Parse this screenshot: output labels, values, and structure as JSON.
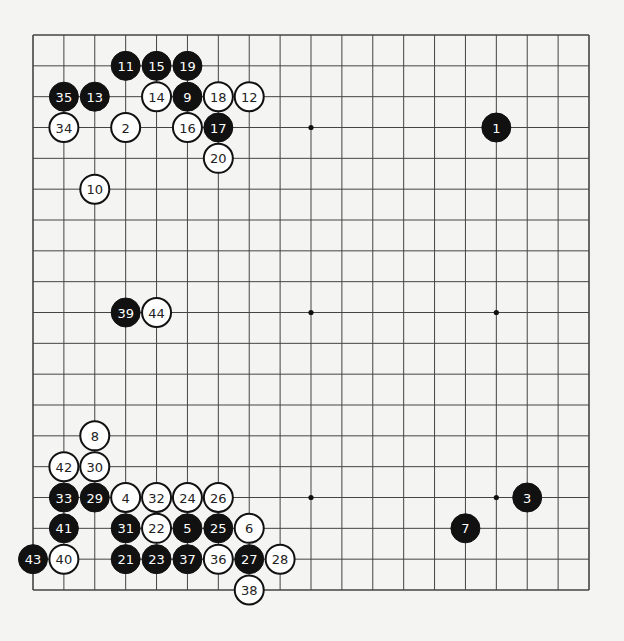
{
  "game": {
    "board_size": 19,
    "star_points": [
      [
        3,
        3
      ],
      [
        3,
        9
      ],
      [
        3,
        15
      ],
      [
        9,
        3
      ],
      [
        9,
        9
      ],
      [
        9,
        15
      ],
      [
        15,
        3
      ],
      [
        15,
        9
      ],
      [
        15,
        15
      ]
    ],
    "colors": {
      "black": "#111111",
      "white": "#ffffff",
      "line": "#444444",
      "board": "#f4f4f2"
    },
    "stones": [
      {
        "n": 1,
        "color": "black",
        "col": 15,
        "row": 3
      },
      {
        "n": 2,
        "color": "white",
        "col": 3,
        "row": 3
      },
      {
        "n": 3,
        "color": "black",
        "col": 16,
        "row": 15
      },
      {
        "n": 4,
        "color": "white",
        "col": 3,
        "row": 15
      },
      {
        "n": 5,
        "color": "black",
        "col": 5,
        "row": 16
      },
      {
        "n": 6,
        "color": "white",
        "col": 7,
        "row": 16
      },
      {
        "n": 7,
        "color": "black",
        "col": 14,
        "row": 16
      },
      {
        "n": 8,
        "color": "white",
        "col": 2,
        "row": 13
      },
      {
        "n": 9,
        "color": "black",
        "col": 5,
        "row": 2
      },
      {
        "n": 10,
        "color": "white",
        "col": 2,
        "row": 5
      },
      {
        "n": 11,
        "color": "black",
        "col": 3,
        "row": 1
      },
      {
        "n": 12,
        "color": "white",
        "col": 7,
        "row": 2
      },
      {
        "n": 13,
        "color": "black",
        "col": 2,
        "row": 2
      },
      {
        "n": 14,
        "color": "white",
        "col": 4,
        "row": 2
      },
      {
        "n": 15,
        "color": "black",
        "col": 4,
        "row": 1
      },
      {
        "n": 16,
        "color": "white",
        "col": 5,
        "row": 3
      },
      {
        "n": 17,
        "color": "black",
        "col": 6,
        "row": 3
      },
      {
        "n": 18,
        "color": "white",
        "col": 6,
        "row": 2
      },
      {
        "n": 19,
        "color": "black",
        "col": 5,
        "row": 1
      },
      {
        "n": 20,
        "color": "white",
        "col": 6,
        "row": 4
      },
      {
        "n": 21,
        "color": "black",
        "col": 3,
        "row": 17
      },
      {
        "n": 22,
        "color": "white",
        "col": 4,
        "row": 16
      },
      {
        "n": 23,
        "color": "black",
        "col": 4,
        "row": 17
      },
      {
        "n": 24,
        "color": "white",
        "col": 5,
        "row": 15
      },
      {
        "n": 25,
        "color": "black",
        "col": 6,
        "row": 16
      },
      {
        "n": 26,
        "color": "white",
        "col": 6,
        "row": 15
      },
      {
        "n": 27,
        "color": "black",
        "col": 7,
        "row": 17
      },
      {
        "n": 28,
        "color": "white",
        "col": 8,
        "row": 17
      },
      {
        "n": 29,
        "color": "black",
        "col": 2,
        "row": 15
      },
      {
        "n": 30,
        "color": "white",
        "col": 2,
        "row": 14
      },
      {
        "n": 31,
        "color": "black",
        "col": 3,
        "row": 16
      },
      {
        "n": 32,
        "color": "white",
        "col": 4,
        "row": 15
      },
      {
        "n": 33,
        "color": "black",
        "col": 1,
        "row": 15
      },
      {
        "n": 34,
        "color": "white",
        "col": 1,
        "row": 3
      },
      {
        "n": 35,
        "color": "black",
        "col": 1,
        "row": 2
      },
      {
        "n": 36,
        "color": "white",
        "col": 6,
        "row": 17
      },
      {
        "n": 37,
        "color": "black",
        "col": 5,
        "row": 17
      },
      {
        "n": 38,
        "color": "white",
        "col": 7,
        "row": 18
      },
      {
        "n": 39,
        "color": "black",
        "col": 3,
        "row": 9
      },
      {
        "n": 40,
        "color": "white",
        "col": 1,
        "row": 17
      },
      {
        "n": 41,
        "color": "black",
        "col": 1,
        "row": 16
      },
      {
        "n": 42,
        "color": "white",
        "col": 1,
        "row": 14
      },
      {
        "n": 43,
        "color": "black",
        "col": 0,
        "row": 17
      },
      {
        "n": 44,
        "color": "white",
        "col": 4,
        "row": 9
      }
    ]
  }
}
